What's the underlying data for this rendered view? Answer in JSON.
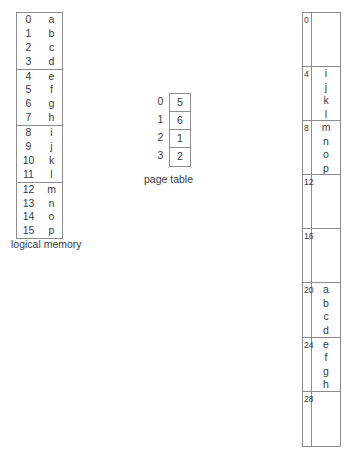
{
  "figure": {
    "line_color": "#8c8c8c",
    "text_color": "#3a3a3a"
  },
  "logical_memory": {
    "label": "logical memory",
    "rows": [
      {
        "index": "0",
        "value": "a"
      },
      {
        "index": "1",
        "value": "b"
      },
      {
        "index": "2",
        "value": "c"
      },
      {
        "index": "3",
        "value": "d"
      },
      {
        "index": "4",
        "value": "e"
      },
      {
        "index": "5",
        "value": "f"
      },
      {
        "index": "6",
        "value": "g"
      },
      {
        "index": "7",
        "value": "h"
      },
      {
        "index": "8",
        "value": "i"
      },
      {
        "index": "9",
        "value": "j"
      },
      {
        "index": "10",
        "value": "k"
      },
      {
        "index": "11",
        "value": "l"
      },
      {
        "index": "12",
        "value": "m"
      },
      {
        "index": "13",
        "value": "n"
      },
      {
        "index": "14",
        "value": "o"
      },
      {
        "index": "15",
        "value": "p"
      }
    ],
    "pages": [
      {
        "page_number": "0",
        "entries": [
          "a",
          "b",
          "c",
          "d"
        ]
      },
      {
        "page_number": "1",
        "entries": [
          "e",
          "f",
          "g",
          "h"
        ]
      },
      {
        "page_number": "2",
        "entries": [
          "i",
          "j",
          "k",
          "l"
        ]
      },
      {
        "page_number": "3",
        "entries": [
          "m",
          "n",
          "o",
          "p"
        ]
      }
    ]
  },
  "page_table": {
    "label": "page table",
    "rows": [
      {
        "index": "0",
        "frame": "5"
      },
      {
        "index": "1",
        "frame": "6"
      },
      {
        "index": "2",
        "frame": "1"
      },
      {
        "index": "3",
        "frame": "2"
      }
    ]
  },
  "physical_memory": {
    "label": "",
    "frames": [
      {
        "address": "0",
        "cells": [
          "",
          "",
          "",
          ""
        ]
      },
      {
        "address": "4",
        "cells": [
          "i",
          "j",
          "k",
          "l"
        ]
      },
      {
        "address": "8",
        "cells": [
          "m",
          "n",
          "o",
          "p"
        ]
      },
      {
        "address": "12",
        "cells": [
          "",
          "",
          "",
          ""
        ]
      },
      {
        "address": "16",
        "cells": [
          "",
          "",
          "",
          ""
        ]
      },
      {
        "address": "20",
        "cells": [
          "a",
          "b",
          "c",
          "d"
        ]
      },
      {
        "address": "24",
        "cells": [
          "e",
          "f",
          "g",
          "h"
        ]
      },
      {
        "address": "28",
        "cells": [
          "",
          "",
          "",
          ""
        ]
      }
    ]
  }
}
